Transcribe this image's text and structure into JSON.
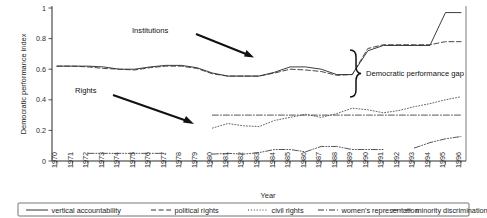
{
  "figure": {
    "yaxis_title": "Democratic performance index",
    "xaxis_title": "Year",
    "y_ticks": [
      "0",
      "0.2",
      "0.4",
      "0.6",
      "0.8",
      "1"
    ],
    "x_ticks": [
      "1970",
      "1971",
      "1972",
      "1973",
      "1974",
      "1975",
      "1976",
      "1977",
      "1978",
      "1979",
      "1980",
      "1981",
      "1982",
      "1983",
      "1984",
      "1985",
      "1986",
      "1987",
      "1988",
      "1989",
      "1990",
      "1991",
      "1992",
      "1993",
      "1994",
      "1995",
      "1996"
    ],
    "annotations": [
      {
        "name": "institutions",
        "text": "Institutions"
      },
      {
        "name": "rights",
        "text": "Rights"
      },
      {
        "name": "gap",
        "text": "Democratic performance gap"
      }
    ]
  },
  "legend": {
    "items": [
      {
        "label": "vertical accountability",
        "style": "solid"
      },
      {
        "label": "political rights",
        "style": "dashed"
      },
      {
        "label": "civil rights",
        "style": "dotted"
      },
      {
        "label": "women's representation",
        "style": "dash-dot"
      },
      {
        "label": "minority discrimination",
        "style": "dash-dot-dot"
      }
    ]
  },
  "chart_data": {
    "type": "line",
    "title": "",
    "xlabel": "Year",
    "ylabel": "Democratic performance index",
    "ylim": [
      0,
      1
    ],
    "xlim": [
      1970,
      1996
    ],
    "grid": false,
    "legend_position": "bottom",
    "x": [
      1970,
      1971,
      1972,
      1973,
      1974,
      1975,
      1976,
      1977,
      1978,
      1979,
      1980,
      1981,
      1982,
      1983,
      1984,
      1985,
      1986,
      1987,
      1988,
      1989,
      1990,
      1991,
      1992,
      1993,
      1994,
      1995,
      1996
    ],
    "series": [
      {
        "name": "vertical accountability",
        "style": "solid",
        "color": "#333333",
        "values": [
          0.62,
          0.62,
          0.62,
          0.615,
          0.6,
          0.6,
          0.615,
          0.625,
          0.625,
          0.61,
          0.575,
          0.555,
          0.555,
          0.555,
          0.58,
          0.615,
          0.615,
          0.6,
          0.565,
          0.565,
          0.72,
          0.755,
          0.755,
          0.755,
          0.755,
          0.97,
          0.97
        ]
      },
      {
        "name": "political rights",
        "style": "dashed",
        "color": "#333333",
        "values": [
          0.62,
          0.62,
          0.615,
          0.605,
          0.6,
          0.595,
          0.61,
          0.62,
          0.62,
          0.605,
          0.57,
          0.555,
          0.555,
          0.555,
          0.575,
          0.6,
          0.595,
          0.585,
          0.56,
          0.565,
          0.735,
          0.76,
          0.76,
          0.76,
          0.76,
          0.78,
          0.78
        ]
      },
      {
        "name": "civil rights",
        "style": "dotted",
        "color": "#555555",
        "values": [
          null,
          null,
          null,
          null,
          null,
          null,
          null,
          null,
          null,
          null,
          0.215,
          0.245,
          0.23,
          0.225,
          0.265,
          0.285,
          0.305,
          0.285,
          0.31,
          0.345,
          0.335,
          0.315,
          0.33,
          0.355,
          0.375,
          0.4,
          0.42
        ]
      },
      {
        "name": "women's representation",
        "style": "dash-dot",
        "color": "#444444",
        "values": [
          null,
          null,
          null,
          null,
          null,
          null,
          null,
          null,
          null,
          null,
          0.3,
          0.3,
          0.3,
          0.3,
          0.3,
          0.3,
          0.3,
          0.3,
          0.3,
          0.3,
          0.3,
          0.3,
          0.3,
          0.3,
          0.3,
          0.3,
          0.3
        ]
      },
      {
        "name": "minority discrimination",
        "style": "dash-dot-dot",
        "color": "#444444",
        "values": [
          null,
          null,
          0.05,
          0.05,
          0.05,
          0.05,
          0.05,
          0.05,
          null,
          null,
          0.045,
          0.05,
          0.045,
          0.055,
          0.075,
          0.075,
          0.06,
          0.095,
          0.095,
          0.075,
          0.075,
          0.075,
          null,
          0.085,
          0.12,
          0.145,
          0.16
        ]
      }
    ]
  }
}
